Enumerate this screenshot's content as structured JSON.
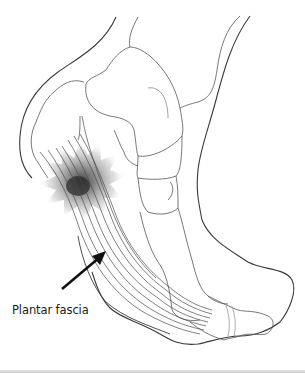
{
  "figure": {
    "label": "Plantar fascia",
    "colors": {
      "outline": "#3a3a3a",
      "bone_outline": "#555555",
      "fascia_lines": "#4a4a4a",
      "inflammation": "#8a8a8a",
      "arrow": "#111111",
      "background": "#ffffff"
    }
  }
}
